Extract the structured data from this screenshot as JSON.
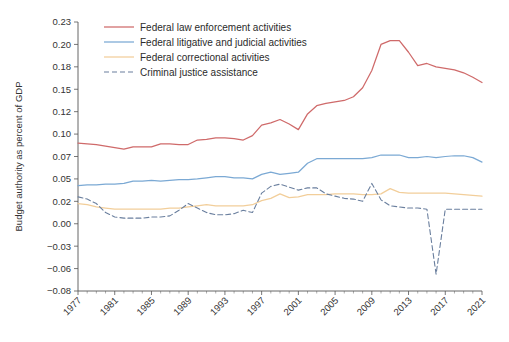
{
  "chart_data": {
    "type": "line",
    "title": "",
    "xlabel": "",
    "ylabel": "Budget authority as percent of GDP",
    "xlim": [
      1977,
      2021
    ],
    "ylim": [
      -0.08,
      0.23
    ],
    "grid": false,
    "legend_position": "top-center",
    "x_tick_labels": [
      "1977",
      "1981",
      "1985",
      "1989",
      "1993",
      "1997",
      "2001",
      "2005",
      "2009",
      "2013",
      "2017",
      "2021"
    ],
    "x_tick_values": [
      1977,
      1981,
      1985,
      1989,
      1993,
      1997,
      2001,
      2005,
      2009,
      2013,
      2017,
      2021
    ],
    "x_minor_tick_step": 1,
    "y_tick_labels": [
      "0.23",
      "0.20",
      "0.18",
      "0.15",
      "0.12",
      "0.10",
      "0.07",
      "0.05",
      "0.02",
      "0.00",
      "-0.03",
      "-0.06",
      "-0.08"
    ],
    "y_tick_values": [
      0.23,
      0.2,
      0.18,
      0.15,
      0.12,
      0.1,
      0.07,
      0.05,
      0.02,
      0.0,
      -0.03,
      -0.06,
      -0.08
    ],
    "x": [
      1977,
      1978,
      1979,
      1980,
      1981,
      1982,
      1983,
      1984,
      1985,
      1986,
      1987,
      1988,
      1989,
      1990,
      1991,
      1992,
      1993,
      1994,
      1995,
      1996,
      1997,
      1998,
      1999,
      2000,
      2001,
      2002,
      2003,
      2004,
      2005,
      2006,
      2007,
      2008,
      2009,
      2010,
      2011,
      2012,
      2013,
      2014,
      2015,
      2016,
      2017,
      2018,
      2019,
      2020,
      2021
    ],
    "series": [
      {
        "name": "Federal law enforcement activities",
        "color": "#cf6a6a",
        "style": "solid",
        "values": [
          0.088,
          0.087,
          0.086,
          0.084,
          0.082,
          0.08,
          0.083,
          0.083,
          0.083,
          0.087,
          0.087,
          0.086,
          0.086,
          0.092,
          0.093,
          0.095,
          0.095,
          0.094,
          0.092,
          0.098,
          0.108,
          0.11,
          0.113,
          0.109,
          0.104,
          0.118,
          0.128,
          0.131,
          0.133,
          0.135,
          0.14,
          0.152,
          0.175,
          0.2,
          0.205,
          0.205,
          0.193,
          0.181,
          0.183,
          0.18,
          0.178,
          0.176,
          0.172,
          0.166,
          0.159
        ]
      },
      {
        "name": "Federal litigative and judicial activities",
        "color": "#7ba9d4",
        "style": "solid",
        "values": [
          0.041,
          0.042,
          0.042,
          0.043,
          0.043,
          0.044,
          0.047,
          0.047,
          0.048,
          0.047,
          0.048,
          0.049,
          0.049,
          0.05,
          0.051,
          0.052,
          0.052,
          0.051,
          0.051,
          0.05,
          0.054,
          0.056,
          0.054,
          0.055,
          0.056,
          0.064,
          0.068,
          0.068,
          0.068,
          0.068,
          0.068,
          0.068,
          0.069,
          0.072,
          0.072,
          0.072,
          0.069,
          0.069,
          0.07,
          0.069,
          0.07,
          0.071,
          0.071,
          0.069,
          0.065
        ]
      },
      {
        "name": "Federal correctional activities",
        "color": "#f2ce9a",
        "style": "solid",
        "values": [
          0.018,
          0.017,
          0.015,
          0.014,
          0.013,
          0.013,
          0.013,
          0.013,
          0.013,
          0.013,
          0.014,
          0.014,
          0.015,
          0.016,
          0.017,
          0.016,
          0.016,
          0.016,
          0.016,
          0.017,
          0.021,
          0.024,
          0.03,
          0.025,
          0.026,
          0.029,
          0.029,
          0.029,
          0.03,
          0.03,
          0.03,
          0.029,
          0.029,
          0.03,
          0.037,
          0.032,
          0.031,
          0.031,
          0.031,
          0.031,
          0.031,
          0.03,
          0.029,
          0.028,
          0.027
        ]
      },
      {
        "name": "Criminal justice assistance",
        "color": "#6a7f9e",
        "style": "dashed",
        "values": [
          0.026,
          0.023,
          0.018,
          0.01,
          0.006,
          0.005,
          0.005,
          0.005,
          0.006,
          0.006,
          0.007,
          0.012,
          0.018,
          0.014,
          0.01,
          0.008,
          0.008,
          0.009,
          0.012,
          0.01,
          0.031,
          0.04,
          0.043,
          0.039,
          0.035,
          0.038,
          0.038,
          0.03,
          0.027,
          0.024,
          0.023,
          0.02,
          0.044,
          0.022,
          0.016,
          0.015,
          0.014,
          0.014,
          0.013,
          -0.065,
          0.013,
          0.013,
          0.013,
          0.013,
          0.013
        ]
      }
    ]
  },
  "legend": {
    "items": [
      {
        "label": "Federal law enforcement activities"
      },
      {
        "label": "Federal litigative and judicial activities"
      },
      {
        "label": "Federal correctional activities"
      },
      {
        "label": "Criminal justice assistance"
      }
    ]
  }
}
